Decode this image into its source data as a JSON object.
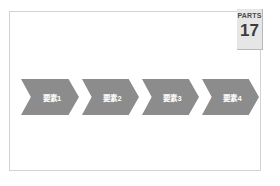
{
  "slide": {
    "badge": {
      "word": "PARTS",
      "number": "17"
    },
    "diagram": {
      "type": "chevron-process",
      "steps": [
        {
          "label": "要素1"
        },
        {
          "label": "要素2"
        },
        {
          "label": "要素3"
        },
        {
          "label": "要素4"
        }
      ]
    },
    "colors": {
      "chevron_fill": "#8c8c8c",
      "chevron_text": "#ffffff",
      "badge_background": "#e6e6e6",
      "badge_text": "#3d3d3d",
      "frame_border": "#d2d2d2",
      "page_background": "#ffffff"
    }
  }
}
